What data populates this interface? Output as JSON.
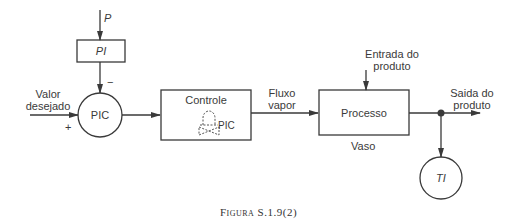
{
  "diagram": {
    "blocks": {
      "pi": {
        "label": "PI"
      },
      "pic": {
        "label": "PIC"
      },
      "controle": {
        "label": "Controle",
        "valve_tag": "PIC"
      },
      "processo": {
        "label": "Processo",
        "sublabel": "Vaso"
      },
      "ti": {
        "label": "TI"
      }
    },
    "signals": {
      "p": "P",
      "minus": "−",
      "plus": "+",
      "setpoint_line1": "Valor",
      "setpoint_line2": "desejado",
      "steam_line1": "Fluxo",
      "steam_line2": "vapor",
      "inlet_line1": "Entrada do",
      "inlet_line2": "produto",
      "outlet_line1": "Saida do",
      "outlet_line2": "produto"
    },
    "caption": "Figura S.1.9(2)",
    "colors": {
      "stroke": "#3a3a3a",
      "text": "#3a3a3a"
    }
  }
}
